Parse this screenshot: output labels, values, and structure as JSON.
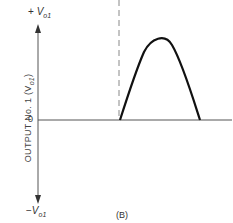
{
  "diagram": {
    "y_axis_label": "OUTPUT No. 1 (V",
    "y_axis_label_sub": "o1",
    "y_axis_label_close": ")",
    "top_label_prefix": "+",
    "top_label_v": "V",
    "top_label_sub": "o1",
    "bottom_label_prefix": "−",
    "bottom_label_v": "V",
    "bottom_label_sub": "o1",
    "zero_label": "0",
    "caption": "(B)",
    "colors": {
      "axis": "#555555",
      "waveform": "#111111",
      "dashed": "#888888"
    }
  }
}
